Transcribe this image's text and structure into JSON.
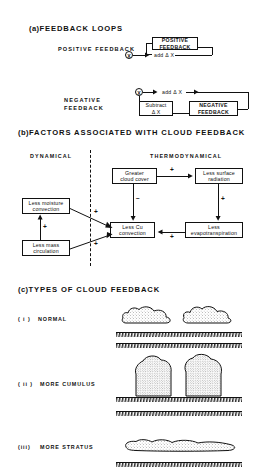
{
  "figure": {
    "sections": [
      {
        "id": "a",
        "paren": "(a)",
        "title": "FEEDBACK LOOPS",
        "items": [
          {
            "label": "POSITIVE FEEDBACK",
            "node": "X",
            "edge_label": "add Δ X",
            "box": "POSITIVE FEEDBACK"
          },
          {
            "label_line1": "NEGATIVE",
            "label_line2": "FEEDBACK",
            "node": "X",
            "edge_label": "add Δ X",
            "box1_line1": "Subtract",
            "box1_line2": "Δ X",
            "box2": "NEGATIVE FEEDBACK"
          }
        ]
      },
      {
        "id": "b",
        "paren": "(b)",
        "title": "FACTORS ASSOCIATED WITH CLOUD FEEDBACK",
        "column_left": "DYNAMICAL",
        "column_right": "THERMODYNAMICAL",
        "nodes": [
          {
            "key": "greater_cloud_cover",
            "line1": "Greater",
            "line2": "cloud cover"
          },
          {
            "key": "less_surface_radiation",
            "line1": "Less surface",
            "line2": "radiation"
          },
          {
            "key": "less_moisture_convection",
            "line1": "Less moisture",
            "line2": "convection"
          },
          {
            "key": "less_mass_circulation",
            "line1": "Less mass",
            "line2": "circulation"
          },
          {
            "key": "less_cu_convection",
            "line1": "Less Cu",
            "line2": "convection"
          },
          {
            "key": "less_evapotranspiration",
            "line1": "Less",
            "line2": "evapotranspiration"
          }
        ],
        "signs": {
          "cover_to_radiation": "+",
          "cover_to_cu": "−",
          "radiation_to_evap": "+",
          "evap_to_cu": "+",
          "moisture_to_cu": "+",
          "mass_to_cu": "+",
          "mass_to_moisture": "+"
        }
      },
      {
        "id": "c",
        "paren": "(c)",
        "title": "TYPES OF CLOUD FEEDBACK",
        "cases": [
          {
            "numeral": "( i )",
            "label": "NORMAL",
            "cloud_type": "cumulus-pair-small"
          },
          {
            "numeral": "( ii )",
            "label": "MORE CUMULUS",
            "cloud_type": "cumulus-pair-tall"
          },
          {
            "numeral": "(iii)",
            "label": "MORE STRATUS",
            "cloud_type": "stratus-sheet"
          }
        ]
      }
    ]
  },
  "colors": {
    "ink": "#111111",
    "paper": "#ffffff"
  }
}
